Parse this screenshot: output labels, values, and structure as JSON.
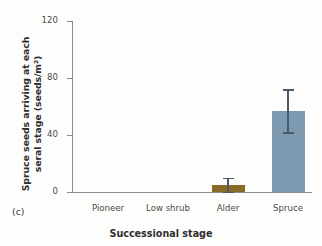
{
  "figure": {
    "panel_label": "(c)"
  },
  "chart_data": {
    "type": "bar",
    "title": "",
    "xlabel": "Successional stage",
    "ylabel_line1": "Spruce seeds arriving at each",
    "ylabel_line2": "seral stage  (seeds/m²)",
    "categories": [
      "Pioneer",
      "Low shrub",
      "Alder",
      "Spruce"
    ],
    "values": [
      0,
      0,
      5,
      57
    ],
    "errors": [
      0,
      0,
      5,
      15
    ],
    "error_low": [
      0,
      0,
      5,
      15
    ],
    "error_high": [
      0,
      0,
      5,
      15
    ],
    "bar_colors": [
      "#8a6a28",
      "#8a6a28",
      "#8a6a28",
      "#7e9ab0"
    ],
    "ylim": [
      0,
      120
    ],
    "yticks": [
      0,
      40,
      80,
      120
    ],
    "ytick_labels": [
      "0",
      "40",
      "80",
      "120"
    ],
    "grid": false,
    "legend": "none",
    "errorbar_color": "#4b5a66",
    "axis_color": "#8c8c8c"
  }
}
